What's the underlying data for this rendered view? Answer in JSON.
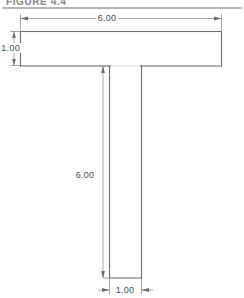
{
  "figure": {
    "header_label": "FIGURE 4.4",
    "title_rule": "horizontal-rule"
  },
  "drawing": {
    "name": "t-beam-cross-section",
    "shape": "T-section",
    "line_color": "#707070",
    "fill_color": "#ffffff",
    "background_color": "#ffffff",
    "text_color": "#4a4a4a"
  },
  "dimensions": [
    {
      "id": "flange-width",
      "value": "6.00",
      "orientation": "horizontal",
      "position": "top",
      "arrows": "inward"
    },
    {
      "id": "flange-thickness",
      "value": "1.00",
      "orientation": "vertical",
      "position": "left",
      "arrows": "inward"
    },
    {
      "id": "web-height",
      "value": "6.00",
      "orientation": "vertical",
      "position": "center-left",
      "arrows": "inward"
    },
    {
      "id": "web-width",
      "value": "1.00",
      "orientation": "horizontal",
      "position": "bottom",
      "arrows": "outward"
    }
  ],
  "geometry": {
    "flange": {
      "x": 20,
      "y": 31,
      "width": 202,
      "height": 35
    },
    "web": {
      "x": 109,
      "y": 66,
      "width": 33,
      "height": 212
    }
  }
}
